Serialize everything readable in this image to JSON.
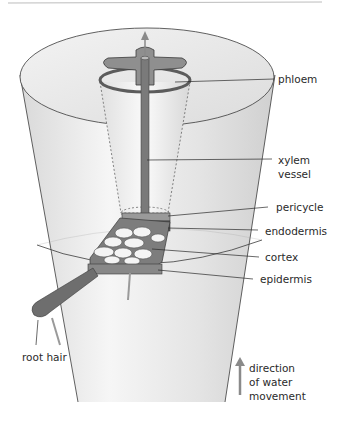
{
  "diagram": {
    "labels": {
      "phloem": "phloem",
      "xylem_line1": "xylem",
      "xylem_line2": "vessel",
      "pericycle": "pericycle",
      "endodermis": "endodermis",
      "cortex": "cortex",
      "epidermis": "epidermis",
      "root_hair": "root hair",
      "direction_line1": "direction",
      "direction_line2": "of water",
      "direction_line3": "movement"
    },
    "colors": {
      "outline": "#3a3a3a",
      "cylinder_fill": "#eeeeee",
      "tissue_dark": "#6d6d6d",
      "arrow": "#8a8a8a",
      "top_rule": "#bdbdbd"
    }
  }
}
